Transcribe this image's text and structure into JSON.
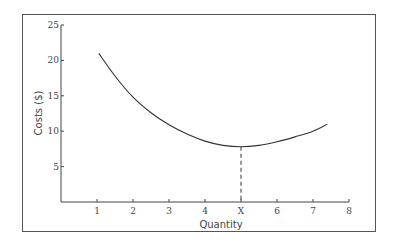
{
  "chart_data": {
    "type": "line",
    "title": "",
    "xlabel": "Quantity",
    "ylabel": "Costs ($)",
    "xlim": [
      0,
      8
    ],
    "ylim": [
      0,
      25
    ],
    "x_ticks": [
      "1",
      "2",
      "3",
      "4",
      "X",
      "6",
      "7",
      "8"
    ],
    "x_tick_values": [
      1,
      2,
      3,
      4,
      5,
      6,
      7,
      8
    ],
    "y_ticks": [
      "5",
      "10",
      "15",
      "20",
      "25"
    ],
    "y_tick_values": [
      5,
      10,
      15,
      20,
      25
    ],
    "grid": false,
    "legend": null,
    "series": [
      {
        "name": "Average cost curve",
        "x": [
          1.05,
          1.5,
          2,
          2.5,
          3,
          3.5,
          4,
          4.5,
          5,
          5.5,
          6,
          6.5,
          7,
          7.4
        ],
        "values": [
          21,
          17.8,
          14.8,
          12.6,
          10.9,
          9.6,
          8.6,
          8.0,
          7.8,
          8.0,
          8.5,
          9.2,
          10.0,
          11.0
        ]
      }
    ],
    "annotations": [
      {
        "type": "dashed-vertical-line",
        "x": 5,
        "from_y": 0,
        "to_y": 7.8,
        "label": "X",
        "note": "Quantity at minimum cost"
      }
    ]
  }
}
